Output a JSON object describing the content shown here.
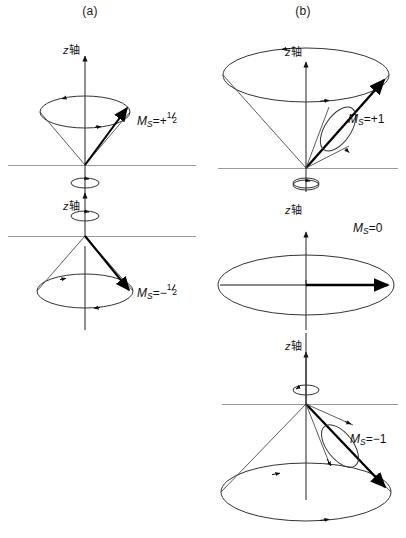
{
  "figure": {
    "title_a": "(a)",
    "title_b": "(b)",
    "axis_label_italic": "z",
    "axis_label_cjk": "轴",
    "line_color": "#1a1a1a",
    "reference_line_color": "#9a9a9a",
    "vector_color": "#000000",
    "cone_edge_color": "#4a4a4a",
    "background": "#ffffff"
  },
  "panels": [
    {
      "id": "panel-a",
      "header": "(a)",
      "diagrams": [
        {
          "id": "spin-up-half",
          "ms_prefix": "M",
          "ms_sub": "S",
          "ms_eq": "=",
          "ms_sign": "+",
          "ms_numerator": "1",
          "ms_denominator": "2",
          "ms_value": "+1/2",
          "axis_label": "z轴",
          "cone_direction": "up",
          "vector_direction": "up-right"
        },
        {
          "id": "spin-down-half",
          "ms_prefix": "M",
          "ms_sub": "S",
          "ms_eq": "=",
          "ms_sign": "−",
          "ms_numerator": "1",
          "ms_denominator": "2",
          "ms_value": "-1/2",
          "axis_label": "z轴",
          "cone_direction": "down",
          "vector_direction": "down-right"
        }
      ]
    },
    {
      "id": "panel-b",
      "header": "(b)",
      "diagrams": [
        {
          "id": "spin-plus-one",
          "ms_prefix": "M",
          "ms_sub": "S",
          "ms_eq": "=",
          "ms_value": "+1",
          "axis_label": "z轴",
          "cone_direction": "up",
          "vector_direction": "up-right"
        },
        {
          "id": "spin-zero",
          "ms_prefix": "M",
          "ms_sub": "S",
          "ms_eq": "=",
          "ms_value": "0",
          "axis_label": "z轴",
          "cone_direction": "flat",
          "vector_direction": "right"
        },
        {
          "id": "spin-minus-one",
          "ms_prefix": "M",
          "ms_sub": "S",
          "ms_eq": "=",
          "ms_value": "−1",
          "axis_label": "z轴",
          "cone_direction": "down",
          "vector_direction": "down-right"
        }
      ]
    }
  ]
}
